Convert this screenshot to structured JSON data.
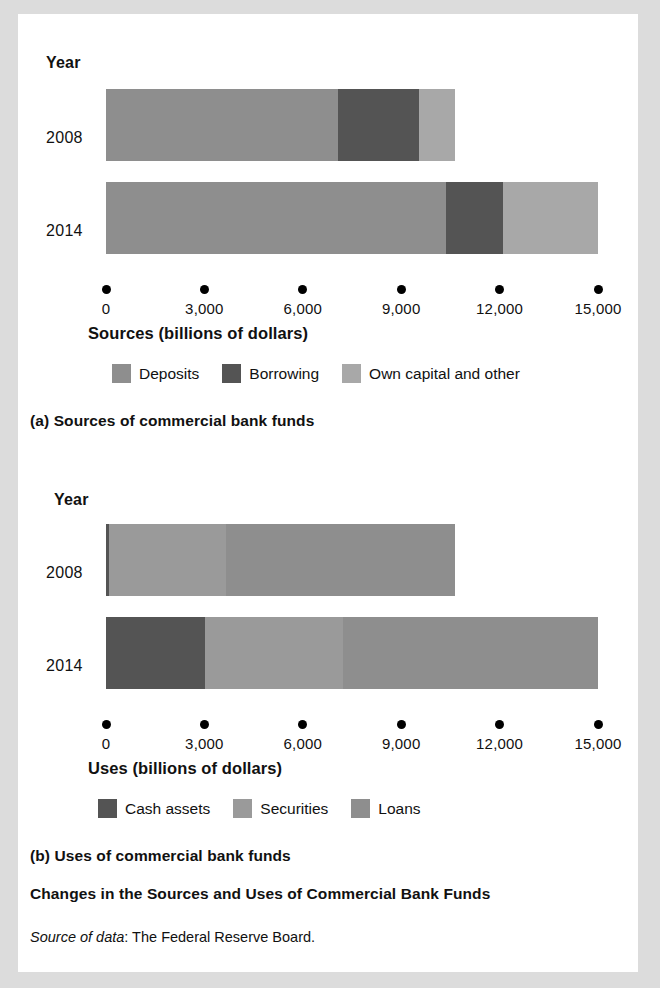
{
  "figure": {
    "title": "Changes in the Sources and Uses of Commercial Bank Funds",
    "source_prefix": "Source of data",
    "source_text": ": The Federal Reserve Board."
  },
  "panel_a": {
    "caption": "(a) Sources of commercial bank funds",
    "year_header": "Year",
    "axis_title": "Sources (billions of dollars)"
  },
  "panel_b": {
    "caption": "(b) Uses of commercial bank funds",
    "year_header": "Year",
    "axis_title": "Uses (billions of dollars)"
  },
  "colors": {
    "light": "#a8a8a8",
    "mid": "#8e8e8e",
    "dark": "#545454",
    "axis": "#000000",
    "page_border": "#dcdcdc"
  },
  "chart_data": [
    {
      "type": "bar",
      "orientation": "horizontal",
      "stacked": true,
      "title": "(a) Sources of commercial bank funds",
      "xlabel": "Sources (billions of dollars)",
      "ylabel": "Year",
      "xlim": [
        0,
        15000
      ],
      "xticks": [
        0,
        3000,
        6000,
        9000,
        12000,
        15000
      ],
      "xticklabels": [
        "0",
        "3,000",
        "6,000",
        "9,000",
        "12,000",
        "15,000"
      ],
      "categories": [
        "2008",
        "2014"
      ],
      "grid": false,
      "legend_position": "bottom",
      "series": [
        {
          "name": "Deposits",
          "color": "#8e8e8e",
          "values": [
            7080,
            10360
          ]
        },
        {
          "name": "Borrowing",
          "color": "#545454",
          "values": [
            2460,
            1740
          ]
        },
        {
          "name": "Own capital and other",
          "color": "#a8a8a8",
          "values": [
            1110,
            2900
          ]
        }
      ],
      "totals": [
        10650,
        15000
      ]
    },
    {
      "type": "bar",
      "orientation": "horizontal",
      "stacked": true,
      "title": "(b) Uses of commercial bank funds",
      "xlabel": "Uses (billions of dollars)",
      "ylabel": "Year",
      "xlim": [
        0,
        15000
      ],
      "xticks": [
        0,
        3000,
        6000,
        9000,
        12000,
        15000
      ],
      "xticklabels": [
        "0",
        "3,000",
        "6,000",
        "9,000",
        "12,000",
        "15,000"
      ],
      "categories": [
        "2008",
        "2014"
      ],
      "grid": false,
      "legend_position": "bottom",
      "series": [
        {
          "name": "Cash assets",
          "color": "#545454",
          "values": [
            90,
            3030
          ]
        },
        {
          "name": "Securities",
          "color": "#9a9a9a",
          "values": [
            3570,
            4200
          ]
        },
        {
          "name": "Loans",
          "color": "#8e8e8e",
          "values": [
            6990,
            7770
          ]
        }
      ],
      "totals": [
        10650,
        15000
      ]
    }
  ]
}
